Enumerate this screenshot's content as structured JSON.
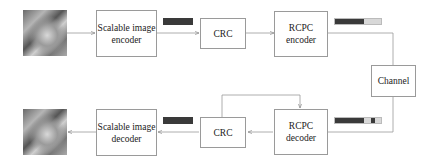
{
  "diagram": {
    "encoder_chain": {
      "input_image": "test-image",
      "blocks": [
        {
          "id": "scalable-image-encoder",
          "label": "Scalable image encoder"
        },
        {
          "id": "crc-encoder",
          "label": "CRC"
        },
        {
          "id": "rcpc-encoder",
          "label": "RCPC encoder"
        }
      ]
    },
    "channel": {
      "label": "Channel"
    },
    "decoder_chain": {
      "blocks": [
        {
          "id": "rcpc-decoder",
          "label": "RCPC decoder"
        },
        {
          "id": "crc-decoder",
          "label": "CRC"
        },
        {
          "id": "scalable-image-decoder",
          "label": "Scalable image decoder"
        }
      ],
      "output_image": "reconstructed-image"
    },
    "bitstreams": {
      "source_bits_color": "#3a3a3a",
      "parity_bits_color": "#d8d8d8"
    }
  }
}
